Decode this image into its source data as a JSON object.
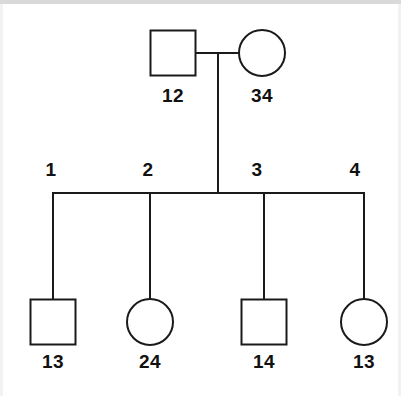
{
  "diagram": {
    "type": "pedigree-chart",
    "generations": 2,
    "stroke_color": "#1a1a1a",
    "background_color": "#ffffff",
    "line_width": 2
  },
  "generation_one": {
    "father": {
      "shape": "square",
      "sex": "male",
      "label": "12",
      "cx": 173,
      "cy": 53,
      "size": 45
    },
    "mother": {
      "shape": "circle",
      "sex": "female",
      "label": "34",
      "cx": 262,
      "cy": 53,
      "r": 23
    },
    "mating_line_y": 53,
    "descent_line_x": 218
  },
  "sibship": {
    "line_y": 193,
    "left_x": 53,
    "right_x": 364,
    "position_labels": [
      {
        "label": "1",
        "x": 51,
        "y": 164
      },
      {
        "label": "2",
        "x": 148,
        "y": 164
      },
      {
        "label": "3",
        "x": 257,
        "y": 164
      },
      {
        "label": "4",
        "x": 355,
        "y": 164
      }
    ]
  },
  "generation_two": {
    "children": [
      {
        "shape": "square",
        "sex": "male",
        "label": "13",
        "cx": 53,
        "cy": 322,
        "size": 45,
        "drop_line_x": 53
      },
      {
        "shape": "circle",
        "sex": "female",
        "label": "24",
        "cx": 150,
        "cy": 322,
        "r": 23,
        "drop_line_x": 150
      },
      {
        "shape": "square",
        "sex": "male",
        "label": "14",
        "cx": 264,
        "cy": 322,
        "size": 45,
        "drop_line_x": 264
      },
      {
        "shape": "circle",
        "sex": "female",
        "label": "13",
        "cx": 364,
        "cy": 322,
        "r": 23,
        "drop_line_x": 364
      }
    ],
    "label_y": 356
  }
}
